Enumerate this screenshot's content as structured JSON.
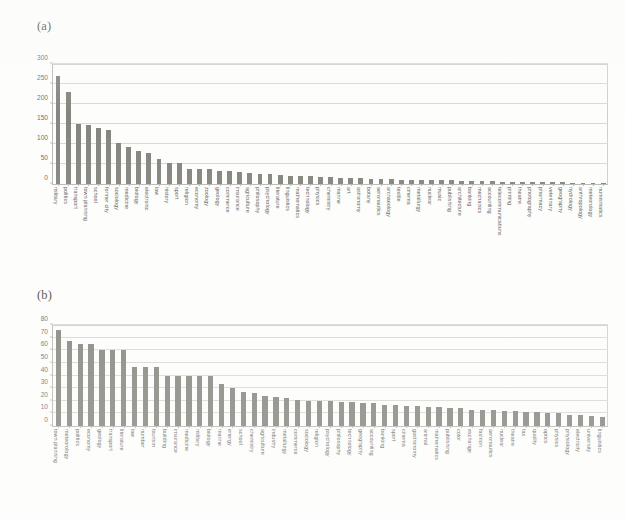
{
  "figure": {
    "panel_a_label": "(a)",
    "panel_b_label": "(b)"
  },
  "chart_data": [
    {
      "type": "bar",
      "panel": "(a)",
      "title": "",
      "xlabel": "",
      "ylabel": "",
      "ylim": [
        0,
        300
      ],
      "yticks": [
        0,
        50,
        100,
        150,
        200,
        250,
        300
      ],
      "grid": true,
      "legend": "none",
      "bar_color": "#85857f",
      "categories": [
        "military",
        "politics",
        "transport",
        "town planning",
        "school",
        "former city",
        "sociology",
        "medicine",
        "biology",
        "electronic",
        "law",
        "history",
        "sport",
        "religion",
        "economy",
        "zoology",
        "geology",
        "commerce",
        "insurance",
        "agriculture",
        "philosophy",
        "psychology",
        "literature",
        "linguistics",
        "mathematics",
        "technology",
        "physics",
        "chemistry",
        "marine",
        "art",
        "astronomy",
        "botany",
        "aeronautics",
        "archaeology",
        "textile",
        "cinema",
        "metallurgy",
        "nuclear",
        "music",
        "publishing",
        "architecture",
        "banking",
        "mechanics",
        "accounting",
        "telecommunications",
        "printing",
        "theatre",
        "photography",
        "pharmacy",
        "veterinary",
        "geography",
        "hydrology",
        "anthropology",
        "meteorology",
        "numismatics"
      ],
      "values": [
        270,
        230,
        151,
        148,
        139,
        136,
        103,
        92,
        83,
        78,
        62,
        53,
        52,
        38,
        38,
        37,
        33,
        32,
        30,
        28,
        26,
        24,
        23,
        21,
        20,
        19,
        18,
        17,
        16,
        15,
        14,
        13,
        12,
        12,
        11,
        11,
        10,
        10,
        9,
        9,
        8,
        8,
        7,
        7,
        6,
        6,
        5,
        5,
        4,
        4,
        4,
        3,
        3,
        2,
        2
      ]
    },
    {
      "type": "bar",
      "panel": "(b)",
      "title": "",
      "xlabel": "",
      "ylabel": "",
      "ylim": [
        0,
        80
      ],
      "yticks": [
        0,
        10,
        20,
        30,
        40,
        50,
        60,
        70,
        80
      ],
      "grid": true,
      "legend": "none",
      "bar_color": "#85857f",
      "categories": [
        "town planning",
        "meteorology",
        "politics",
        "economy",
        "geology",
        "transport",
        "literature",
        "law",
        "number",
        "tourism",
        "building",
        "insurance",
        "medicine",
        "military",
        "biology",
        "marine",
        "energy",
        "school",
        "chemistry",
        "agriculture",
        "industry",
        "metallurgy",
        "commerce",
        "sociology",
        "religion",
        "psychology",
        "philosophy",
        "technology",
        "geography",
        "accounting",
        "banking",
        "sport",
        "cinema",
        "gastronomy",
        "animal",
        "mathematics",
        "publishing",
        "color",
        "exchange",
        "fashion",
        "aeronautics",
        "nuclear",
        "theatre",
        "tax",
        "quality",
        "optics",
        "physics",
        "physiology",
        "electricity",
        "university",
        "linguistics"
      ],
      "values": [
        76,
        67,
        65,
        65,
        60,
        60,
        60,
        47,
        47,
        47,
        40,
        40,
        40,
        40,
        40,
        33,
        30,
        27,
        26,
        24,
        23,
        22,
        21,
        20,
        20,
        20,
        19,
        19,
        18,
        18,
        17,
        17,
        16,
        16,
        15,
        15,
        14,
        14,
        13,
        13,
        13,
        12,
        12,
        11,
        11,
        10,
        10,
        9,
        9,
        8,
        7
      ]
    }
  ]
}
